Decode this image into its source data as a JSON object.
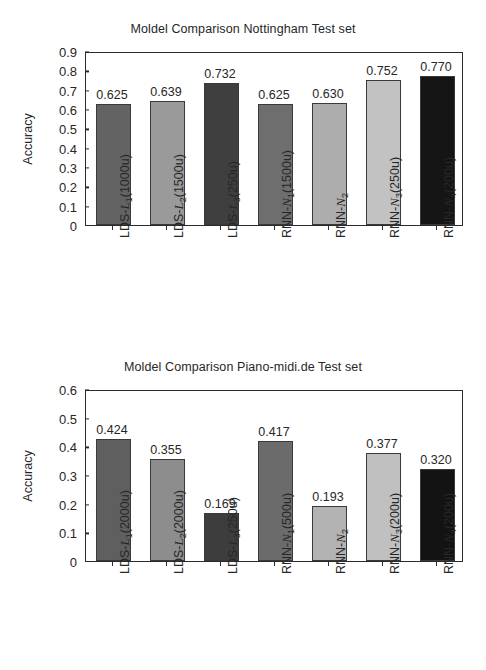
{
  "chart_data": [
    {
      "id": "nottingham",
      "type": "bar",
      "title": "Moldel Comparison Nottingham Test set",
      "xlabel": "",
      "ylabel": "Accuracy",
      "ylim": [
        0,
        0.9
      ],
      "yticks": [
        "0",
        "0.1",
        "0.2",
        "0.3",
        "0.4",
        "0.5",
        "0.6",
        "0.7",
        "0.8",
        "0.9"
      ],
      "grid": false,
      "legend": "none",
      "categories": [
        "LDS-L1(1000u)",
        "LDS-L2(1500u)",
        "LDS-L3(250u)",
        "RNN-N1(1500u)",
        "RNN-N2",
        "RNN-N3(250u)",
        "RNN-N4(200u)"
      ],
      "category_parts": [
        {
          "prefix": "LDS-",
          "sym": "L",
          "sub": "1",
          "suffix": "(1000u)"
        },
        {
          "prefix": "LDS-",
          "sym": "L",
          "sub": "2",
          "suffix": "(1500u)"
        },
        {
          "prefix": "LDS-",
          "sym": "L",
          "sub": "3",
          "suffix": "(250u)"
        },
        {
          "prefix": "RNN-",
          "sym": "N",
          "sub": "1",
          "suffix": "(1500u)"
        },
        {
          "prefix": "RNN-",
          "sym": "N",
          "sub": "2",
          "suffix": ""
        },
        {
          "prefix": "RNN-",
          "sym": "N",
          "sub": "3",
          "suffix": "(250u)"
        },
        {
          "prefix": "RNN-",
          "sym": "N",
          "sub": "4",
          "suffix": "(200u)"
        }
      ],
      "values": [
        0.625,
        0.639,
        0.732,
        0.625,
        0.63,
        0.752,
        0.77
      ],
      "value_labels": [
        "0.625",
        "0.639",
        "0.732",
        "0.625",
        "0.630",
        "0.752",
        "0.770"
      ],
      "bar_colors": [
        "#636363",
        "#9a9a9a",
        "#3f3f3f",
        "#6e6e6e",
        "#adadad",
        "#c2c2c2",
        "#151515"
      ]
    },
    {
      "id": "piano-midi",
      "type": "bar",
      "title": "Moldel Comparison Piano-midi.de Test set",
      "xlabel": "",
      "ylabel": "Accuracy",
      "ylim": [
        0,
        0.6
      ],
      "yticks": [
        "0",
        "0.1",
        "0.2",
        "0.3",
        "0.4",
        "0.5",
        "0.6"
      ],
      "grid": false,
      "legend": "none",
      "categories": [
        "LDS-L1(2000u)",
        "LDS-L2(2000u)",
        "LDS-L3(250u)",
        "RNN-N1(500u)",
        "RNN-N2",
        "RNN-N3(200u)",
        "RNN-N4(200u)"
      ],
      "category_parts": [
        {
          "prefix": "LDS-",
          "sym": "L",
          "sub": "1",
          "suffix": "(2000u)"
        },
        {
          "prefix": "LDS-",
          "sym": "L",
          "sub": "2",
          "suffix": "(2000u)"
        },
        {
          "prefix": "LDS-",
          "sym": "L",
          "sub": "3",
          "suffix": "(250u)"
        },
        {
          "prefix": "RNN-",
          "sym": "N",
          "sub": "1",
          "suffix": "(500u)"
        },
        {
          "prefix": "RNN-",
          "sym": "N",
          "sub": "2",
          "suffix": ""
        },
        {
          "prefix": "RNN-",
          "sym": "N",
          "sub": "3",
          "suffix": "(200u)"
        },
        {
          "prefix": "RNN-",
          "sym": "N",
          "sub": "4",
          "suffix": "(200u)"
        }
      ],
      "values": [
        0.424,
        0.355,
        0.169,
        0.417,
        0.193,
        0.377,
        0.32
      ],
      "value_labels": [
        "0.424",
        "0.355",
        "0.169",
        "0.417",
        "0.193",
        "0.377",
        "0.320"
      ],
      "bar_colors": [
        "#5f5f5f",
        "#8d8d8d",
        "#3d3d3d",
        "#6b6b6b",
        "#b3b3b3",
        "#c0c0c0",
        "#131313"
      ]
    }
  ],
  "style": {
    "axis_color": "#2b2b2b",
    "text_color": "#272727",
    "background": "#ffffff"
  }
}
